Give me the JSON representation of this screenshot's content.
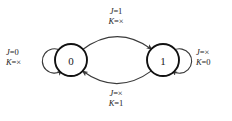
{
  "diagram": {
    "type": "state-transition-diagram",
    "colors": {
      "background": "#ffffff",
      "state_stroke": "#111111",
      "arc_stroke": "#3a3a3a",
      "text": "#1d1d1d"
    },
    "states": [
      {
        "id": "state-0",
        "label": "0",
        "cx": 71,
        "cy": 60,
        "r": 16
      },
      {
        "id": "state-1",
        "label": "1",
        "cx": 163,
        "cy": 60,
        "r": 16
      }
    ],
    "transitions": [
      {
        "id": "self-loop-0",
        "from": "0",
        "to": "0",
        "position": "left",
        "label": {
          "j_symbol": "J",
          "j_value": "=0",
          "k_symbol": "K",
          "k_value": "=×"
        }
      },
      {
        "id": "arc-0-to-1",
        "from": "0",
        "to": "1",
        "position": "top",
        "label": {
          "j_symbol": "J",
          "j_value": "=1",
          "k_symbol": "K",
          "k_value": "=×"
        }
      },
      {
        "id": "arc-1-to-0",
        "from": "1",
        "to": "0",
        "position": "bottom",
        "label": {
          "j_symbol": "J",
          "j_value": "=×",
          "k_symbol": "K",
          "k_value": "=1"
        }
      },
      {
        "id": "self-loop-1",
        "from": "1",
        "to": "1",
        "position": "right",
        "label": {
          "j_symbol": "J",
          "j_value": "=×",
          "k_symbol": "K",
          "k_value": "=0"
        }
      }
    ]
  }
}
